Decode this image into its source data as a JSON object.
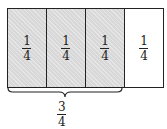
{
  "diagram": {
    "cells": [
      {
        "numerator": "1",
        "denominator": "4",
        "shaded": true
      },
      {
        "numerator": "1",
        "denominator": "4",
        "shaded": true
      },
      {
        "numerator": "1",
        "denominator": "4",
        "shaded": true
      },
      {
        "numerator": "1",
        "denominator": "4",
        "shaded": false
      }
    ],
    "brace_label": {
      "numerator": "3",
      "denominator": "4"
    },
    "colors": {
      "shaded": "#d8d8d8",
      "line": "#222222",
      "background": "#ffffff"
    }
  }
}
